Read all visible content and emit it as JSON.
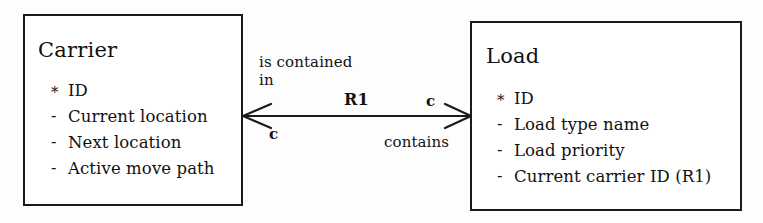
{
  "diagram": {
    "type": "entity-relationship-diagram",
    "entities": [
      {
        "name": "Carrier",
        "attributes": [
          {
            "marker": "*",
            "label": "ID"
          },
          {
            "marker": "-",
            "label": "Current location"
          },
          {
            "marker": "-",
            "label": "Next location"
          },
          {
            "marker": "-",
            "label": "Active move path"
          }
        ]
      },
      {
        "name": "Load",
        "attributes": [
          {
            "marker": "*",
            "label": "ID"
          },
          {
            "marker": "-",
            "label": "Load type name"
          },
          {
            "marker": "-",
            "label": "Load priority"
          },
          {
            "marker": "-",
            "label": "Current carrier ID (R1)"
          }
        ]
      }
    ],
    "relationship": {
      "id": "R1",
      "phrase_forward_line1": "is contained",
      "phrase_forward_line2": "in",
      "phrase_reverse": "contains",
      "multiplicity_right_top": "c",
      "multiplicity_left_bottom": "c",
      "line_color": "#1a1a1a"
    }
  }
}
